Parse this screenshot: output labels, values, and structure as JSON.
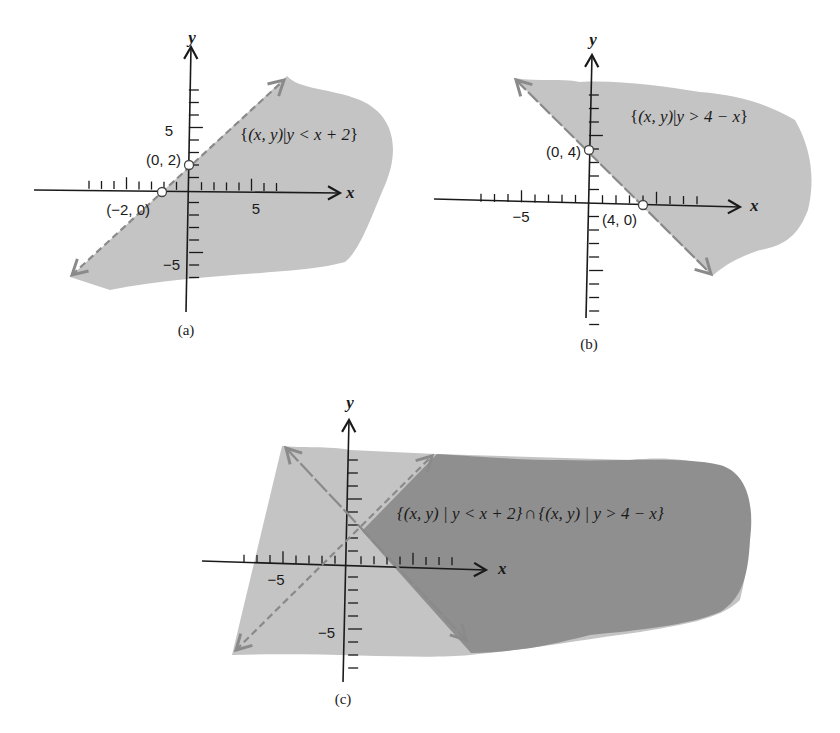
{
  "colors": {
    "light_region": "#c4c4c4",
    "dark_region": "#8f8f8f",
    "boundary": "#8a8a8a",
    "axis": "#1a1a1a",
    "open_point_fill": "#ffffff"
  },
  "panels": [
    {
      "id": "a",
      "caption": "(a)",
      "origin": [
        189,
        190
      ],
      "unit": 12.5,
      "x_axis_label": "x",
      "y_axis_label": "y",
      "tick_labels": [
        {
          "text": "5",
          "axis": "x",
          "value": 5
        },
        {
          "text": "5",
          "axis": "y",
          "value": 5
        },
        {
          "text": "−5",
          "axis": "y",
          "value": -5
        }
      ],
      "set_label": "{(x, y) | y < x + 2}",
      "boundary": "y = x + 2",
      "inequality": "y < x + 2",
      "points": [
        {
          "label": "(0, 2)",
          "x": 0,
          "y": 2
        },
        {
          "label": "(−2, 0)",
          "x": -2,
          "y": 0
        }
      ]
    },
    {
      "id": "b",
      "caption": "(b)",
      "origin": [
        589,
        203
      ],
      "unit": 13.5,
      "x_axis_label": "x",
      "y_axis_label": "y",
      "tick_labels": [
        {
          "text": "−5",
          "axis": "x",
          "value": -5
        }
      ],
      "set_label": "{(x, y) | y > 4 − x}",
      "boundary": "y = 4 − x",
      "inequality": "y > 4 − x",
      "points": [
        {
          "label": "(0, 4)",
          "x": 0,
          "y": 4
        },
        {
          "label": "(4, 0)",
          "x": 4,
          "y": 0
        }
      ]
    },
    {
      "id": "c",
      "caption": "(c)",
      "origin": [
        348,
        564
      ],
      "unit": 13,
      "x_axis_label": "x",
      "y_axis_label": "y",
      "tick_labels": [
        {
          "text": "−5",
          "axis": "x",
          "value": -5
        },
        {
          "text": "−5",
          "axis": "y",
          "value": -5
        }
      ],
      "set_label": "{(x, y) | y < x + 2} ∩ {(x, y) | y > 4 − x}",
      "boundaries": [
        "y = x + 2",
        "y = 4 − x"
      ],
      "intersection_point": {
        "x": 1,
        "y": 3
      }
    }
  ],
  "text": {
    "a_set_open": "{",
    "a_set_body": "(x, y)",
    "a_set_bar": "|",
    "a_set_cond": "y < x + 2",
    "a_set_close": "}",
    "b_set_open": "{",
    "b_set_body": "(x, y)",
    "b_set_bar": "|",
    "b_set_cond": "y > 4 − x",
    "b_set_close": "}",
    "c_set_part1": "{(x, y) | y < x + 2}",
    "c_set_cap": "∩",
    "c_set_part2": "{(x, y) | y > 4 − x}",
    "a_x5": "5",
    "a_y5": "5",
    "a_ym5": "−5",
    "a_pt1": "(0, 2)",
    "a_pt2": "(−2, 0)",
    "b_xm5": "−5",
    "b_pt1": "(0, 4)",
    "b_pt2": "(4, 0)",
    "c_xm5": "−5",
    "c_ym5": "−5",
    "x": "x",
    "y": "y",
    "cap_a": "(a)",
    "cap_b": "(b)",
    "cap_c": "(c)"
  }
}
